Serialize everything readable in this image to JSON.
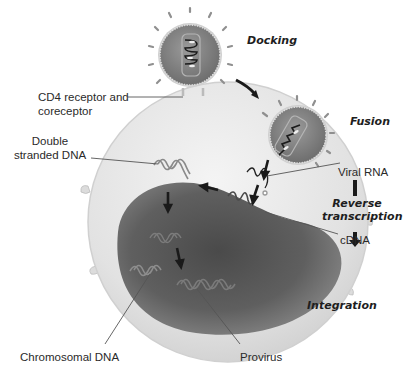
{
  "stages": {
    "docking": "Docking",
    "fusion": "Fusion",
    "reverse_transcription_line1": "Reverse",
    "reverse_transcription_line2": "transcription",
    "integration": "Integration"
  },
  "labels": {
    "cd4_line1": "CD4 receptor and",
    "cd4_line2": "coreceptor",
    "dsdna_line1": "Double",
    "dsdna_line2": "stranded DNA",
    "viral_rna": "Viral RNA",
    "cdna": "cDNA",
    "chromosomal_dna": "Chromosomal DNA",
    "provirus": "Provirus"
  },
  "colors": {
    "cell_fill": "#e6e6e6",
    "nucleus_fill": "#5e5e5e",
    "virus_fill": "#8a8a8a",
    "arrow": "#1a1a1a",
    "leader_line": "#555555"
  }
}
